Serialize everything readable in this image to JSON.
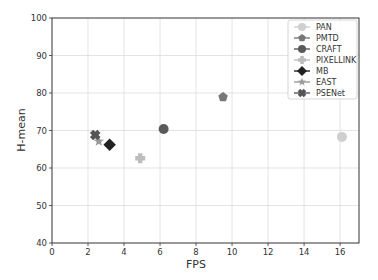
{
  "chart_data": {
    "type": "scatter",
    "title": "",
    "xlabel": "FPS",
    "ylabel": "H-mean",
    "xlim": [
      0,
      17.05
    ],
    "ylim": [
      40,
      100
    ],
    "xticks": [
      0,
      2,
      4,
      6,
      8,
      10,
      12,
      14,
      16
    ],
    "yticks": [
      40,
      50,
      60,
      70,
      80,
      90,
      100
    ],
    "grid": true,
    "legend_position": "upper right",
    "series": [
      {
        "name": "PAN",
        "x": 16.1,
        "y": 68.3,
        "marker": "circle",
        "color": "#cfcfcf"
      },
      {
        "name": "PMTD",
        "x": 9.5,
        "y": 78.9,
        "marker": "pentagon",
        "color": "#777777"
      },
      {
        "name": "CRAFT",
        "x": 6.2,
        "y": 70.4,
        "marker": "circle",
        "color": "#5a5a5a"
      },
      {
        "name": "PIXELLINK",
        "x": 4.9,
        "y": 62.6,
        "marker": "plus",
        "color": "#bdbdbd"
      },
      {
        "name": "MB",
        "x": 3.2,
        "y": 66.2,
        "marker": "diamond",
        "color": "#222222"
      },
      {
        "name": "EAST",
        "x": 2.6,
        "y": 67.1,
        "marker": "star",
        "color": "#9a9a9a"
      },
      {
        "name": "PSENet",
        "x": 2.4,
        "y": 68.8,
        "marker": "x",
        "color": "#555555"
      }
    ]
  }
}
